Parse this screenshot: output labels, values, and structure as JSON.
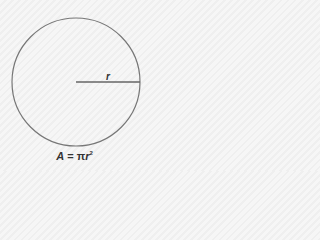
{
  "diagram": {
    "shape": "circle",
    "center": [
      76,
      82
    ],
    "radius": 64,
    "radius_label": "r",
    "stroke_color": "#777777",
    "formula": {
      "lhs": "A",
      "eq": " = ",
      "pi": "π",
      "var": "r",
      "exp": "2"
    }
  }
}
